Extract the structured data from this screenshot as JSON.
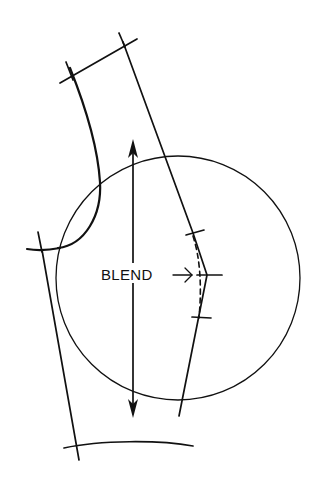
{
  "diagram": {
    "type": "sleeve pattern alteration",
    "labels": {
      "blend": "BLEND"
    },
    "arrow_glyph": "→",
    "elements": [
      "sleeve-cap-top-line",
      "sleeve-left-seam",
      "sleeve-right-seam",
      "blend-dashed-line",
      "alteration-ticks",
      "reference-circle",
      "grainline-arrow",
      "hem-line",
      "underarm-line"
    ],
    "colors": {
      "ink": "#111111",
      "background": "#ffffff"
    }
  }
}
